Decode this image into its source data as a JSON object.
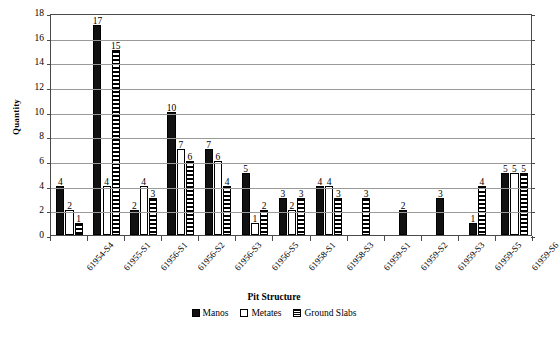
{
  "chart_data": {
    "type": "bar",
    "title": "",
    "xlabel": "Pit Structure",
    "ylabel": "Quantity",
    "ylim": [
      0,
      18
    ],
    "ytick_step": 2,
    "yticks": [
      0,
      2,
      4,
      6,
      8,
      10,
      12,
      14,
      16,
      18
    ],
    "grid": true,
    "legend_position": "bottom",
    "categories": [
      "61954-S4",
      "61955-S1",
      "61956-S1",
      "61956-S2",
      "61956-S3",
      "61956-S5",
      "61958-S1",
      "61958-S3",
      "61959-S1",
      "61959-S2",
      "61959-S3",
      "61959-S5",
      "61959-S6"
    ],
    "series": [
      {
        "name": "Manos",
        "fill": "solid-black",
        "color": "#111111",
        "values": [
          4,
          17,
          2,
          10,
          7,
          5,
          3,
          4,
          null,
          2,
          3,
          1,
          5
        ]
      },
      {
        "name": "Metates",
        "fill": "white-outline",
        "color": "#ffffff",
        "values": [
          2,
          4,
          4,
          7,
          6,
          1,
          2,
          4,
          null,
          null,
          null,
          null,
          5
        ]
      },
      {
        "name": "Ground Slabs",
        "fill": "horizontal-stripes",
        "color": "#000000",
        "values": [
          1,
          15,
          3,
          6,
          4,
          2,
          3,
          3,
          3,
          null,
          null,
          4,
          5
        ]
      }
    ]
  },
  "legend": {
    "items": [
      {
        "label": "Manos"
      },
      {
        "label": "Metates"
      },
      {
        "label": "Ground Slabs"
      }
    ]
  },
  "axes": {
    "y_title": "Quantity",
    "x_title": "Pit Structure"
  }
}
